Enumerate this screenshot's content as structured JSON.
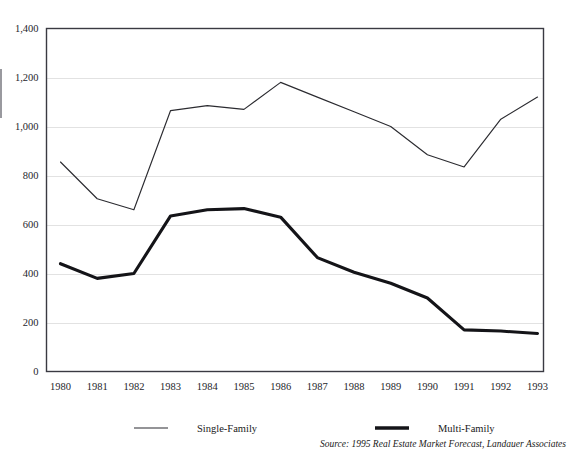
{
  "figure": {
    "clipped_title": "————————",
    "source_note": "Source: 1995 Real Estate Market Forecast, Landauer Associates"
  },
  "legend": {
    "position": "bottom",
    "entries": [
      {
        "label": "Single-Family",
        "style": "thin-line",
        "color": "#2b2b30"
      },
      {
        "label": "Multi-Family",
        "style": "thick-line",
        "color": "#141418"
      }
    ]
  },
  "chart_data": {
    "type": "line",
    "title": "",
    "subtitle": "",
    "xlabel": "",
    "ylabel": "",
    "categories": [
      "1980",
      "1981",
      "1982",
      "1983",
      "1984",
      "1985",
      "1986",
      "1987",
      "1988",
      "1989",
      "1990",
      "1991",
      "1992",
      "1993"
    ],
    "x": [
      1980,
      1981,
      1982,
      1983,
      1984,
      1985,
      1986,
      1987,
      1988,
      1989,
      1990,
      1991,
      1992,
      1993
    ],
    "series": [
      {
        "name": "Single-Family",
        "color": "#2b2b30",
        "line_width": "thin",
        "values": [
          855,
          705,
          660,
          1065,
          1085,
          1070,
          1180,
          1120,
          1060,
          1000,
          885,
          835,
          1030,
          1120
        ]
      },
      {
        "name": "Multi-Family",
        "color": "#141418",
        "line_width": "thick",
        "values": [
          440,
          380,
          400,
          635,
          660,
          665,
          630,
          465,
          405,
          360,
          300,
          170,
          165,
          155
        ]
      }
    ],
    "ylim": [
      0,
      1400
    ],
    "ytick_step": 200,
    "ytick_labels": [
      "0",
      "200",
      "400",
      "600",
      "800",
      "1,000",
      "1,200",
      "1,400"
    ],
    "ytick_values": [
      0,
      200,
      400,
      600,
      800,
      1000,
      1200,
      1400
    ],
    "xtick_labels": [
      "1980",
      "1981",
      "1982",
      "1983",
      "1984",
      "1985",
      "1986",
      "1987",
      "1988",
      "1989",
      "1990",
      "1991",
      "1992",
      "1993"
    ],
    "grid": true,
    "grid_axis": "y",
    "legend_position": "bottom",
    "annotations": []
  }
}
